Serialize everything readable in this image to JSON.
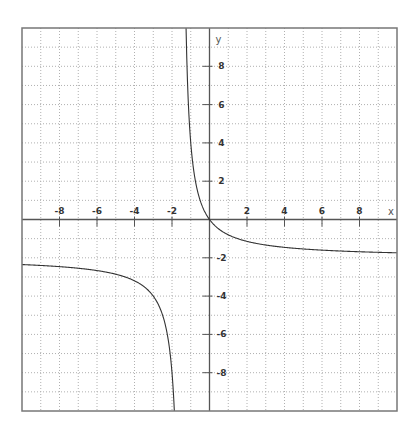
{
  "chart_data": {
    "type": "line",
    "title": "",
    "xlabel": "x",
    "ylabel": "y",
    "xlim": [
      -10,
      10
    ],
    "ylim": [
      -10,
      10
    ],
    "grid": true,
    "grid_step": 1,
    "x_ticks": [
      -8,
      -6,
      -4,
      -2,
      2,
      4,
      6,
      8
    ],
    "x_tick_labels": [
      "-8",
      "-6",
      "-4",
      "-2",
      "2",
      "4",
      "6",
      "8"
    ],
    "y_ticks": [
      8,
      6,
      4,
      2,
      -2,
      -4,
      -6,
      -8
    ],
    "y_tick_labels": [
      "8",
      "6",
      "4",
      "2",
      "-2",
      "-4",
      "-6",
      "-8"
    ],
    "series": [
      {
        "name": "y = -2x/(x+1.5)",
        "function": "-2x/(x+1.5)",
        "vertical_asymptote": -1.5,
        "horizontal_asymptote": -2,
        "branches": [
          {
            "name": "left-branch",
            "x": [
              -10,
              -8,
              -6,
              -4,
              -3,
              -2.5,
              -2.2,
              -2,
              -1.9,
              -1.875
            ],
            "y": [
              -2.35,
              -2.46,
              -2.67,
              -3.2,
              -4.0,
              -5.0,
              -6.29,
              -8.0,
              -9.5,
              -10.0
            ]
          },
          {
            "name": "right-branch",
            "x": [
              -1.25,
              -1.2,
              -1.0,
              -0.75,
              -0.5,
              0,
              1,
              2,
              4,
              6,
              8,
              10
            ],
            "y": [
              10.0,
              8.0,
              4.0,
              2.0,
              1.0,
              0,
              -0.8,
              -1.14,
              -1.45,
              -1.6,
              -1.68,
              -1.74
            ]
          }
        ],
        "color": "#333333"
      }
    ]
  },
  "colors": {
    "frame": "#777777",
    "axis": "#555555",
    "grid": "#b0b0b0",
    "curve": "#333333"
  }
}
